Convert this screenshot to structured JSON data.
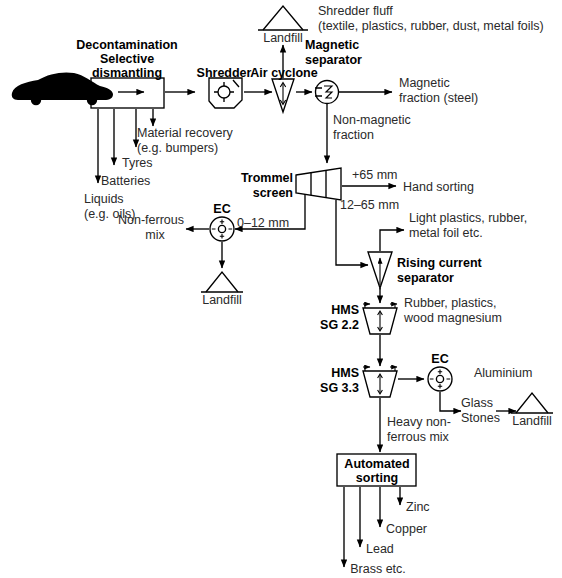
{
  "diagram": {
    "stroke_color": "#000000",
    "text_color": "#262626",
    "bold_color": "#000000"
  },
  "nodes": {
    "car": "car-silhouette",
    "dismantling": {
      "line1": "Decontamination",
      "line2": "Selective",
      "line3": "dismantling"
    },
    "shredder": "Shredder",
    "air_cyclone": "Air cyclone",
    "magnetic_separator": {
      "line1": "Magnetic",
      "line2": "separator"
    },
    "trommel": {
      "line1": "Trommel",
      "line2": "screen"
    },
    "ec_left": "EC",
    "ec_right": "EC",
    "rising_current": {
      "line1": "Rising current",
      "line2": "separator"
    },
    "hms22": {
      "line1": "HMS",
      "line2": "SG 2.2"
    },
    "hms33": {
      "line1": "HMS",
      "line2": "SG 3.3"
    },
    "automated_sorting": {
      "line1": "Automated",
      "line2": "sorting"
    },
    "landfill_top": "Landfill",
    "landfill_mid": "Landfill",
    "landfill_right": "Landfill"
  },
  "outputs": {
    "shredder_fluff_line1": "Shredder fluff",
    "shredder_fluff_line2": "(textile, plastics, rubber, dust, metal foils)",
    "magnetic_fraction_line1": "Magnetic",
    "magnetic_fraction_line2": "fraction (steel)",
    "non_magnetic_line1": "Non-magnetic",
    "non_magnetic_line2": "fraction",
    "material_recovery_line1": "Material recovery",
    "material_recovery_line2": "(e.g. bumpers)",
    "tyres": "Tyres",
    "batteries": "Batteries",
    "liquids_line1": "Liquids",
    "liquids_line2": "(e.g. oils)",
    "hand_sorting": "Hand sorting",
    "non_ferrous_line1": "Non-ferrous",
    "non_ferrous_line2": "mix",
    "light_plastics_line1": "Light plastics, rubber,",
    "light_plastics_line2": "metal foil etc.",
    "rubber_plastics_line1": "Rubber, plastics,",
    "rubber_plastics_line2": "wood magnesium",
    "aluminium": "Aluminium",
    "glass_line1": "Glass",
    "glass_line2": "Stones",
    "heavy_non_ferrous_line1": "Heavy non-",
    "heavy_non_ferrous_line2": "ferrous mix",
    "zinc": "Zinc",
    "copper": "Copper",
    "lead": "Lead",
    "brass": "Brass etc."
  },
  "size_labels": {
    "plus65": "+65 mm",
    "r12_65": "12–65 mm",
    "r0_12": "0–12 mm"
  }
}
